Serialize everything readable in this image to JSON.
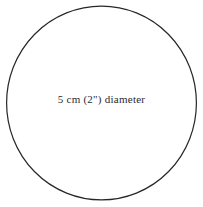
{
  "diagram": {
    "type": "circle-with-centered-label",
    "background_color": "#ffffff",
    "shape": {
      "name": "circle-outline",
      "stroke_color": "#26262b",
      "stroke_width": 1.2,
      "fill": "none",
      "center_x": 101.5,
      "center_y": 103,
      "radius_x": 95.5,
      "radius_y": 97.5
    },
    "label": {
      "text": "5 cm (2\") diameter",
      "color": "#2a2a2e",
      "font_size_px": 11,
      "align": "center"
    },
    "measurements": {
      "metric_value": "5 cm",
      "imperial_value": "2\"",
      "dimension_name": "diameter"
    }
  }
}
